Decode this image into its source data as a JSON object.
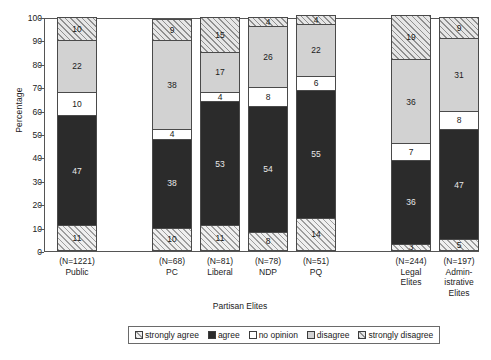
{
  "chart_data": {
    "type": "bar",
    "subtype": "stacked-percentage",
    "title": "",
    "xlabel": "Partisan Elites",
    "ylabel": "Percentage",
    "ylim": [
      0,
      100
    ],
    "yticks": [
      0,
      10,
      20,
      30,
      40,
      50,
      60,
      70,
      80,
      90,
      100
    ],
    "grid": false,
    "legend_position": "bottom",
    "categories": [
      "Public",
      "PC",
      "Liberal",
      "NDP",
      "PQ",
      "Legal Elites",
      "Administrative Elites"
    ],
    "category_labels": [
      {
        "n": "(N=1221)",
        "lines": [
          "Public"
        ]
      },
      {
        "n": "(N=68)",
        "lines": [
          "PC"
        ]
      },
      {
        "n": "(N=81)",
        "lines": [
          "Liberal"
        ]
      },
      {
        "n": "(N=78)",
        "lines": [
          "NDP"
        ]
      },
      {
        "n": "(N=51)",
        "lines": [
          "PQ"
        ]
      },
      {
        "n": "(N=244)",
        "lines": [
          "Legal",
          "Elites"
        ]
      },
      {
        "n": "(N=197)",
        "lines": [
          "Admin-",
          "istrative",
          "Elites"
        ]
      }
    ],
    "sample_sizes": [
      1221,
      68,
      81,
      78,
      51,
      244,
      197
    ],
    "series": [
      {
        "name": "strongly agree",
        "fill": "hatch-light",
        "values": [
          11,
          10,
          11,
          8,
          14,
          3,
          5
        ]
      },
      {
        "name": "agree",
        "fill": "solid-black",
        "values": [
          47,
          38,
          53,
          54,
          55,
          36,
          47
        ]
      },
      {
        "name": "no opinion",
        "fill": "white",
        "values": [
          10,
          4,
          4,
          8,
          6,
          7,
          8
        ]
      },
      {
        "name": "disagree",
        "fill": "light-gray",
        "values": [
          22,
          38,
          17,
          26,
          22,
          36,
          31
        ]
      },
      {
        "name": "strongly disagree",
        "fill": "hatch-dense",
        "values": [
          10,
          9,
          15,
          4,
          4,
          19,
          9
        ]
      }
    ],
    "legend": [
      {
        "label": "strongly agree",
        "swatch": "hatch-light"
      },
      {
        "label": "agree",
        "swatch": "solid-black"
      },
      {
        "label": "no opinion",
        "swatch": "white"
      },
      {
        "label": "disagree",
        "swatch": "light-gray"
      },
      {
        "label": "strongly disagree",
        "swatch": "hatch-dense"
      }
    ],
    "colors": {
      "hatch_light": "#efefef",
      "solid_black": "#2b2b2b",
      "white": "#ffffff",
      "light_gray": "#d2d2d2",
      "hatch_dense": "#e6e6e6",
      "axis": "#555555"
    },
    "bar_x_positions": [
      57,
      152,
      200,
      248,
      296,
      391,
      439
    ],
    "bar_width": 40
  }
}
